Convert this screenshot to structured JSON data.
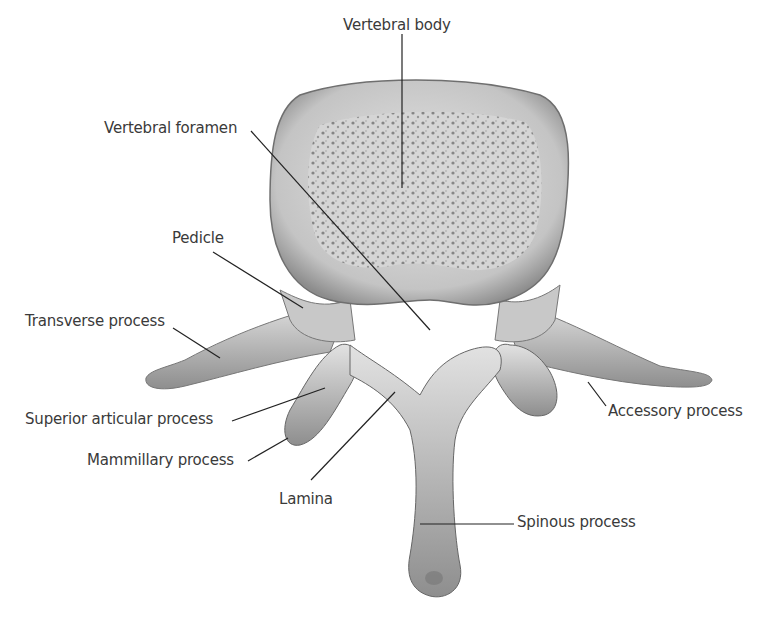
{
  "diagram": {
    "labels": {
      "vertebral_body": "Vertebral body",
      "vertebral_foramen": "Vertebral foramen",
      "pedicle": "Pedicle",
      "transverse_process": "Transverse process",
      "superior_articular_process": "Superior articular process",
      "mammillary_process": "Mammillary process",
      "lamina": "Lamina",
      "spinous_process": "Spinous process",
      "accessory_process": "Accessory process"
    },
    "colors": {
      "bone": "#cfcfcf",
      "bone_shadow": "#8a8a8a",
      "cancellous": "#9a9a9a",
      "text": "#3a3a3a",
      "leader_line": "#222222"
    }
  }
}
